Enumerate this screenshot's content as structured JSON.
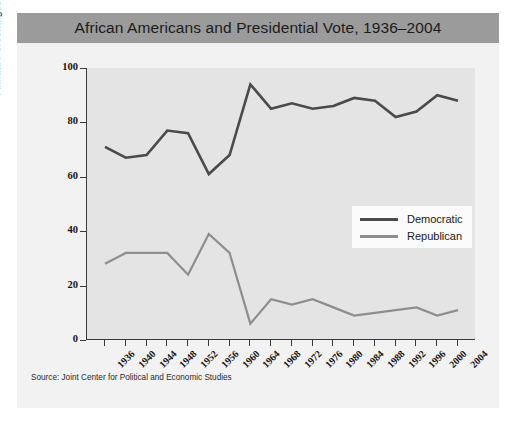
{
  "figure": {
    "title": "African Americans and Presidential Vote, 1936–2004",
    "source": "Source: Joint Center for Political and Economic Studies",
    "colors": {
      "title_bar": "#9b9b9b",
      "panel": "#f2f2f2",
      "plot_area": "#e4e4e4",
      "democratic": "#4a4a4a",
      "republican": "#8e8e8e",
      "axis": "#3a3a3a"
    }
  },
  "legend": {
    "position": "center-right",
    "entries": [
      {
        "label": "Democratic",
        "color": "#4a4a4a"
      },
      {
        "label": "Republican",
        "color": "#8e8e8e"
      }
    ]
  },
  "chart_data": {
    "type": "line",
    "title": "African Americans and Presidential Vote, 1936–2004",
    "xlabel": "",
    "ylabel": "Annual Percentages of African American Votes",
    "grid": false,
    "legend_position": "center-right",
    "xlim": [
      1936,
      2004
    ],
    "ylim": [
      0,
      100
    ],
    "yticks": [
      0,
      20,
      40,
      60,
      80,
      100
    ],
    "categories": [
      "1936",
      "1940",
      "1944",
      "1948",
      "1952",
      "1956",
      "1960",
      "1964",
      "1968",
      "1972",
      "1976",
      "1980",
      "1984",
      "1988",
      "1992",
      "1996",
      "2000",
      "2004"
    ],
    "x": [
      1936,
      1940,
      1944,
      1948,
      1952,
      1956,
      1960,
      1964,
      1968,
      1972,
      1976,
      1980,
      1984,
      1988,
      1992,
      1996,
      2000,
      2004
    ],
    "series": [
      {
        "name": "Democratic",
        "color": "#4a4a4a",
        "values": [
          71,
          67,
          68,
          77,
          76,
          61,
          68,
          94,
          85,
          87,
          85,
          86,
          89,
          88,
          82,
          84,
          90,
          88
        ]
      },
      {
        "name": "Republican",
        "color": "#8e8e8e",
        "values": [
          28,
          32,
          32,
          32,
          24,
          39,
          32,
          6,
          15,
          13,
          15,
          12,
          9,
          10,
          11,
          12,
          9,
          11
        ]
      }
    ]
  }
}
